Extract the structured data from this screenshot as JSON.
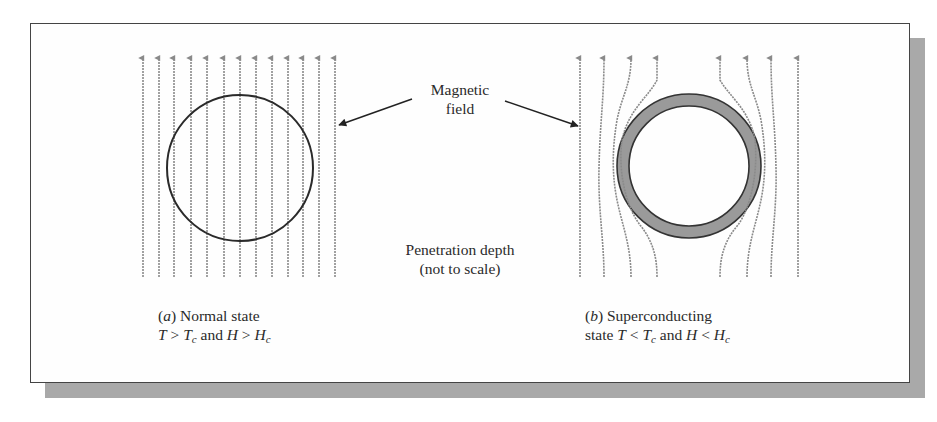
{
  "figure": {
    "callout_magnetic_field": {
      "line1": "Magnetic",
      "line2": "field"
    },
    "callout_penetration_depth": {
      "line1": "Penetration depth",
      "line2": "(not to scale)"
    },
    "panel_a": {
      "tag": "a",
      "title": "Normal state",
      "condition": {
        "T": "T",
        "op1": ">",
        "Tc": "T",
        "Tc_sub": "c",
        "and": "and",
        "H": "H",
        "op2": ">",
        "Hc": "H",
        "Hc_sub": "c"
      },
      "field_lines": 13,
      "description": "Field lines pass straight through the sphere"
    },
    "panel_b": {
      "tag": "b",
      "title": "Superconducting",
      "title_line2": "state",
      "condition": {
        "T": "T",
        "op1": "<",
        "Tc": "T",
        "Tc_sub": "c",
        "and": "and",
        "H": "H",
        "op2": "<",
        "Hc": "H",
        "Hc_sub": "c"
      },
      "field_lines": 8,
      "description": "Field lines are expelled around the sphere; shaded ring shows penetration depth"
    },
    "colors": {
      "field_line": "#8a8a8a",
      "outline": "#2a2a2a",
      "penetration_ring": "#9a9a9a",
      "frame_shadow": "#a9a9a9"
    }
  }
}
